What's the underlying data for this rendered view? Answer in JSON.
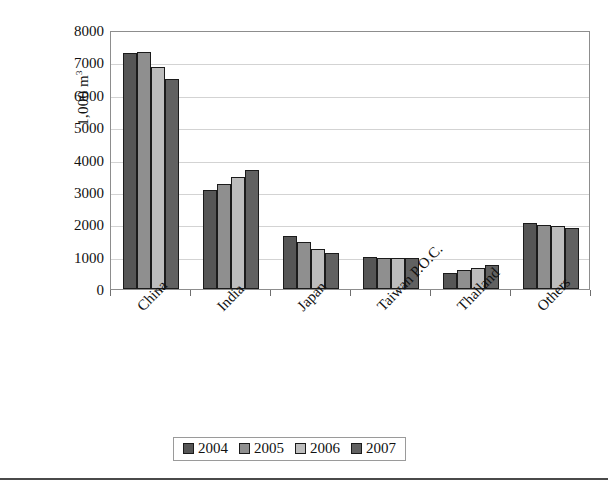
{
  "chart_data": {
    "type": "bar",
    "title": "",
    "subtitle": "",
    "xlabel": "",
    "ylabel": "1,000 m",
    "ylabel_superscript": "3",
    "ylim": [
      0,
      8000
    ],
    "ytick_step": 1000,
    "yticks": [
      "8000",
      "7000",
      "6000",
      "5000",
      "4000",
      "3000",
      "2000",
      "1000",
      "0"
    ],
    "grid": true,
    "legend_position": "bottom-center",
    "categories": [
      "China",
      "India",
      "Japan",
      "Taiwan P.O.C.",
      "Thailand",
      "Others"
    ],
    "series": [
      {
        "name": "2004",
        "color": "#565656",
        "values": [
          7300,
          3050,
          1630,
          1000,
          500,
          2050
        ]
      },
      {
        "name": "2005",
        "color": "#8f8f8f",
        "values": [
          7310,
          3250,
          1450,
          950,
          590,
          1980
        ]
      },
      {
        "name": "2006",
        "color": "#bdbdbd",
        "values": [
          6850,
          3450,
          1250,
          960,
          660,
          1940
        ]
      },
      {
        "name": "2007",
        "color": "#616161",
        "values": [
          6500,
          3680,
          1110,
          950,
          740,
          1870
        ]
      }
    ]
  },
  "legend": {
    "items": [
      {
        "label": "2004"
      },
      {
        "label": "2005"
      },
      {
        "label": "2006"
      },
      {
        "label": "2007"
      }
    ]
  }
}
